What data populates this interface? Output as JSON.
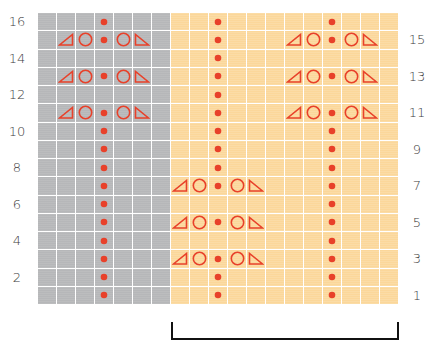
{
  "colors": {
    "grey_section": "#b6b7b9",
    "orange_section": "#fbd79a",
    "grid_lines": "#ffffff",
    "symbol": "#e8412a",
    "label_text": "#3c3c3c",
    "bracket": "#111111"
  },
  "chart": {
    "rows": 16,
    "row_height": 18.25,
    "col_width": 19,
    "left_labels": [
      "16",
      "14",
      "12",
      "10",
      "8",
      "6",
      "4",
      "2"
    ],
    "right_labels": [
      "15",
      "13",
      "11",
      "9",
      "7",
      "5",
      "3",
      "1"
    ],
    "symbol_legend": {
      "dot": "filled-dot",
      "O": "open-circle",
      "L": "left-slant-triangle",
      "R": "right-slant-triangle",
      ".": "empty"
    },
    "grey_section": {
      "columns": 7,
      "rows_top_to_bottom": [
        ".......",
        ".LOdOR.",
        ".......",
        ".LOdOR.",
        ".......",
        ".LOdOR.",
        "...d...",
        "...d...",
        "...d...",
        "...d...",
        "...d...",
        "...d...",
        "...d...",
        "...d...",
        "...d...",
        "...d..."
      ],
      "row16_dot_col": 3
    },
    "orange_section": {
      "columns": 12,
      "rows_top_to_bottom": [
        "..d.....d...",
        "..d...LOdOR.",
        "..d.........",
        "..d...LOdOR.",
        "..d.........",
        "..d...LOdOR.",
        "..d.....d...",
        "..d.....d...",
        "..d.....d...",
        "LOdOR...d...",
        "........d...",
        "LOdOR...d...",
        "........d...",
        "LOdOR...d...",
        "..d.....d...",
        "..d.....d..."
      ]
    }
  },
  "bracket": {
    "label": "",
    "spans_section": "orange"
  }
}
